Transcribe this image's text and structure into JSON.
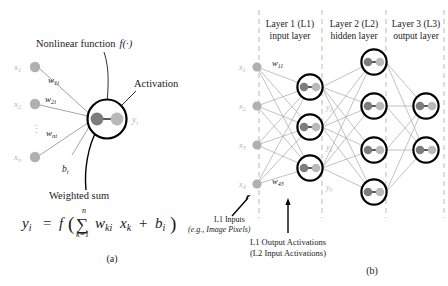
{
  "figure": {
    "panels": [
      {
        "id": "a",
        "caption": "(a)"
      },
      {
        "id": "b",
        "caption": "(b)"
      }
    ]
  },
  "panel_a": {
    "title_nonlinear": "Nonlinear function",
    "title_nonlinear_math": "f(·)",
    "label_activation": "Activation",
    "label_weighted_sum": "Weighted sum",
    "inputs": [
      {
        "label": "x",
        "sub": "1"
      },
      {
        "label": "x",
        "sub": "2"
      },
      {
        "label": "x",
        "sub": "n"
      }
    ],
    "vdots": "⋮",
    "weights": [
      {
        "base": "w",
        "sub": "1i"
      },
      {
        "base": "w",
        "sub": "2i"
      },
      {
        "base": "w",
        "sub": "ni"
      }
    ],
    "bias": {
      "base": "b",
      "sub": "i"
    },
    "output": {
      "base": "y",
      "sub": "i"
    },
    "equation": {
      "lhs_base": "y",
      "lhs_sub": "i",
      "eq": "=",
      "f": "f",
      "paren_open": "(",
      "sigma": "∑",
      "sigma_top": "n",
      "sigma_bottom": "k=1",
      "term1_base": "w",
      "term1_sub": "ki",
      "term2_base": "x",
      "term2_sub": "k",
      "plus": "+",
      "term3_base": "b",
      "term3_sub": "i",
      "paren_close": ")"
    }
  },
  "panel_b": {
    "layer_headers": [
      {
        "line1": "Layer 1 (L1)",
        "line2": "input layer"
      },
      {
        "line1": "Layer 2 (L2)",
        "line2": "hidden layer"
      },
      {
        "line1": "Layer 3 (L3)",
        "line2": "output layer"
      }
    ],
    "inputs": [
      {
        "base": "x",
        "sub": "1"
      },
      {
        "base": "x",
        "sub": "2"
      },
      {
        "base": "x",
        "sub": "3"
      },
      {
        "base": "x",
        "sub": "4"
      }
    ],
    "weight_first": {
      "base": "w",
      "sub": "11"
    },
    "weight_last": {
      "base": "w",
      "sub": "43"
    },
    "activations": [
      {
        "base": "y",
        "sub": "1"
      },
      {
        "base": "y",
        "sub": "2"
      },
      {
        "base": "y",
        "sub": "3"
      }
    ],
    "annotation_inputs": {
      "line1": "L1 Inputs",
      "line2": "(e.g., Image Pixels)"
    },
    "annotation_activations": {
      "line1": "L1 Output Activations",
      "line2": "(L2 Input Activations)"
    },
    "node_counts": {
      "input": 4,
      "l1": 3,
      "l2": 4,
      "l3": 2
    }
  },
  "colors": {
    "background": "#ffffff",
    "text": "#1a1a1a",
    "faint_text": "#b4b4b4",
    "edge": "#a8a8a8",
    "dashed_guide": "#c0c0c0",
    "neuron_outline": "#000000",
    "summation_dot": "#7d7d7d",
    "activation_dot": "#b9b9b9",
    "input_node": "#b0b0b0"
  }
}
